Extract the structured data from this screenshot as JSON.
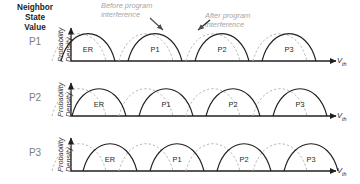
{
  "figure": {
    "header_label": "Neighbor\nState\nValue",
    "header_line1": "Neighbor",
    "header_line2": "State",
    "header_line3": "Value",
    "y_axis_label_line1": "Probability",
    "y_axis_label_line2": "Density",
    "x_axis_label": "V",
    "x_axis_sub": "th",
    "legend": {
      "before": {
        "line1": "Before program",
        "line2": "interference"
      },
      "after": {
        "line1": "After program",
        "line2": "interference"
      }
    },
    "colors": {
      "solid_curve": "#231f20",
      "dashed_curve": "#b3b3b3",
      "axis": "#231f20",
      "row_label": "#7d7d7d",
      "legend_text": "#a6a6a6",
      "background": "#ffffff"
    },
    "rows": [
      {
        "row_label": "P1",
        "shift": 9,
        "states": [
          "ER",
          "P1",
          "P2",
          "P3"
        ]
      },
      {
        "row_label": "P2",
        "shift": 20,
        "states": [
          "ER",
          "P1",
          "P2",
          "P3"
        ]
      },
      {
        "row_label": "P3",
        "shift": 31,
        "states": [
          "ER",
          "P1",
          "P2",
          "P3"
        ]
      }
    ]
  },
  "chart_data": {
    "type": "line",
    "title": "",
    "xlabel": "Vth",
    "ylabel": "Probability Density",
    "grid": false,
    "legend_position": "top",
    "series": [
      {
        "name": "Before program interference",
        "style": "dashed",
        "color": "#b3b3b3",
        "rows": [
          {
            "neighbor_state": "P1",
            "peaks": [
              0,
              67,
              134,
              201
            ]
          },
          {
            "neighbor_state": "P2",
            "peaks": [
              0,
              67,
              134,
              201
            ]
          },
          {
            "neighbor_state": "P3",
            "peaks": [
              0,
              67,
              134,
              201
            ]
          }
        ]
      },
      {
        "name": "After program interference",
        "style": "solid",
        "color": "#231f20",
        "rows": [
          {
            "neighbor_state": "P1",
            "peaks": [
              9,
              76,
              143,
              210
            ]
          },
          {
            "neighbor_state": "P2",
            "peaks": [
              20,
              87,
              154,
              221
            ]
          },
          {
            "neighbor_state": "P3",
            "peaks": [
              31,
              98,
              165,
              232
            ]
          }
        ]
      }
    ],
    "categories": [
      "ER",
      "P1",
      "P2",
      "P3"
    ]
  }
}
